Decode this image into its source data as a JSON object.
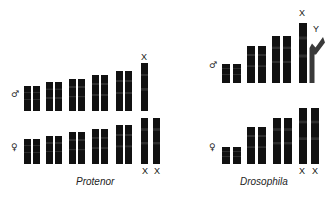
{
  "figure": {
    "background_color": "#ffffff",
    "chromosome_color": "#111111",
    "y_chromosome_color": "#3a3a3a",
    "label_color": "#141414"
  },
  "panels": [
    {
      "id": "protenor",
      "species_label": "Protenor",
      "rows": [
        {
          "id": "protenor-male",
          "sex": "male",
          "sex_symbol": "♂",
          "karyotype_note": "XO",
          "chromosomes": [
            {
              "name": "autosome-1a",
              "kind": "autosome",
              "label": ""
            },
            {
              "name": "autosome-1b",
              "kind": "autosome",
              "label": ""
            },
            {
              "name": "autosome-2a",
              "kind": "autosome",
              "label": ""
            },
            {
              "name": "autosome-2b",
              "kind": "autosome",
              "label": ""
            },
            {
              "name": "autosome-3a",
              "kind": "autosome",
              "label": ""
            },
            {
              "name": "autosome-3b",
              "kind": "autosome",
              "label": ""
            },
            {
              "name": "autosome-4a",
              "kind": "autosome",
              "label": ""
            },
            {
              "name": "autosome-4b",
              "kind": "autosome",
              "label": ""
            },
            {
              "name": "autosome-5a",
              "kind": "autosome",
              "label": ""
            },
            {
              "name": "autosome-5b",
              "kind": "autosome",
              "label": ""
            },
            {
              "name": "x-chromosome",
              "kind": "sex-x",
              "label": "X",
              "label_position": "above"
            }
          ]
        },
        {
          "id": "protenor-female",
          "sex": "female",
          "sex_symbol": "♀",
          "karyotype_note": "XX",
          "chromosomes": [
            {
              "name": "autosome-1a",
              "kind": "autosome",
              "label": ""
            },
            {
              "name": "autosome-1b",
              "kind": "autosome",
              "label": ""
            },
            {
              "name": "autosome-2a",
              "kind": "autosome",
              "label": ""
            },
            {
              "name": "autosome-2b",
              "kind": "autosome",
              "label": ""
            },
            {
              "name": "autosome-3a",
              "kind": "autosome",
              "label": ""
            },
            {
              "name": "autosome-3b",
              "kind": "autosome",
              "label": ""
            },
            {
              "name": "autosome-4a",
              "kind": "autosome",
              "label": ""
            },
            {
              "name": "autosome-4b",
              "kind": "autosome",
              "label": ""
            },
            {
              "name": "autosome-5a",
              "kind": "autosome",
              "label": ""
            },
            {
              "name": "autosome-5b",
              "kind": "autosome",
              "label": ""
            },
            {
              "name": "x-chromosome-1",
              "kind": "sex-x",
              "label": "X",
              "label_position": "below"
            },
            {
              "name": "x-chromosome-2",
              "kind": "sex-x",
              "label": "X",
              "label_position": "below"
            }
          ]
        }
      ]
    },
    {
      "id": "drosophila",
      "species_label": "Drosophila",
      "rows": [
        {
          "id": "drosophila-male",
          "sex": "male",
          "sex_symbol": "♂",
          "karyotype_note": "XY",
          "chromosomes": [
            {
              "name": "autosome-1a",
              "kind": "autosome",
              "label": ""
            },
            {
              "name": "autosome-1b",
              "kind": "autosome",
              "label": ""
            },
            {
              "name": "autosome-2a",
              "kind": "autosome",
              "label": ""
            },
            {
              "name": "autosome-2b",
              "kind": "autosome",
              "label": ""
            },
            {
              "name": "autosome-3a",
              "kind": "autosome",
              "label": ""
            },
            {
              "name": "autosome-3b",
              "kind": "autosome",
              "label": ""
            },
            {
              "name": "x-chromosome",
              "kind": "sex-x",
              "label": "X",
              "label_position": "above"
            },
            {
              "name": "y-chromosome",
              "kind": "sex-y",
              "label": "Y",
              "label_position": "above",
              "shape": "bent-hook"
            }
          ]
        },
        {
          "id": "drosophila-female",
          "sex": "female",
          "sex_symbol": "♀",
          "karyotype_note": "XX",
          "chromosomes": [
            {
              "name": "autosome-1a",
              "kind": "autosome",
              "label": ""
            },
            {
              "name": "autosome-1b",
              "kind": "autosome",
              "label": ""
            },
            {
              "name": "autosome-2a",
              "kind": "autosome",
              "label": ""
            },
            {
              "name": "autosome-2b",
              "kind": "autosome",
              "label": ""
            },
            {
              "name": "autosome-3a",
              "kind": "autosome",
              "label": ""
            },
            {
              "name": "autosome-3b",
              "kind": "autosome",
              "label": ""
            },
            {
              "name": "x-chromosome-1",
              "kind": "sex-x",
              "label": "X",
              "label_position": "below"
            },
            {
              "name": "x-chromosome-2",
              "kind": "sex-x",
              "label": "X",
              "label_position": "below"
            }
          ]
        }
      ]
    }
  ],
  "geometry": {
    "protenor": {
      "male": {
        "baseline_y": 111,
        "sex_symbol": {
          "x": 11,
          "y": 90
        },
        "bars": [
          {
            "x": 24,
            "w": 7,
            "h": 25
          },
          {
            "x": 33,
            "w": 7,
            "h": 25
          },
          {
            "x": 46,
            "w": 7,
            "h": 29
          },
          {
            "x": 55,
            "w": 7,
            "h": 29
          },
          {
            "x": 69,
            "w": 7,
            "h": 32
          },
          {
            "x": 78,
            "w": 7,
            "h": 32
          },
          {
            "x": 92,
            "w": 7,
            "h": 36
          },
          {
            "x": 101,
            "w": 7,
            "h": 36
          },
          {
            "x": 116,
            "w": 7,
            "h": 40
          },
          {
            "x": 125,
            "w": 7,
            "h": 40
          },
          {
            "x": 141,
            "w": 7,
            "h": 48
          }
        ],
        "labels": [
          {
            "text_idx": 10,
            "x": 141,
            "y": 53
          }
        ]
      },
      "female": {
        "baseline_y": 164,
        "sex_symbol": {
          "x": 11,
          "y": 143
        },
        "bars": [
          {
            "x": 24,
            "w": 7,
            "h": 25
          },
          {
            "x": 33,
            "w": 7,
            "h": 25
          },
          {
            "x": 46,
            "w": 7,
            "h": 28
          },
          {
            "x": 55,
            "w": 7,
            "h": 28
          },
          {
            "x": 69,
            "w": 7,
            "h": 32
          },
          {
            "x": 78,
            "w": 7,
            "h": 32
          },
          {
            "x": 92,
            "w": 7,
            "h": 35
          },
          {
            "x": 101,
            "w": 7,
            "h": 35
          },
          {
            "x": 116,
            "w": 7,
            "h": 39
          },
          {
            "x": 125,
            "w": 7,
            "h": 39
          },
          {
            "x": 141,
            "w": 7,
            "h": 46
          },
          {
            "x": 153,
            "w": 7,
            "h": 46
          }
        ],
        "labels": [
          {
            "text_idx": 10,
            "x": 142,
            "y": 167
          },
          {
            "text_idx": 11,
            "x": 154,
            "y": 167
          }
        ]
      },
      "species_label_pos": {
        "x": 76,
        "y": 177
      }
    },
    "drosophila": {
      "male": {
        "baseline_y": 83,
        "sex_symbol": {
          "x": 209,
          "y": 61
        },
        "bars": [
          {
            "x": 222,
            "w": 8,
            "h": 19
          },
          {
            "x": 233,
            "w": 8,
            "h": 19
          },
          {
            "x": 247,
            "w": 8,
            "h": 37
          },
          {
            "x": 258,
            "w": 8,
            "h": 37
          },
          {
            "x": 272,
            "w": 8,
            "h": 47
          },
          {
            "x": 283,
            "w": 8,
            "h": 47
          },
          {
            "x": 299,
            "w": 8,
            "h": 60
          }
        ],
        "ybar": {
          "x": 307,
          "y": 34,
          "w": 18,
          "h": 49
        },
        "labels": [
          {
            "text_idx": 6,
            "x": 299,
            "y": 9
          },
          {
            "text_idx": 7,
            "x": 313,
            "y": 25
          }
        ]
      },
      "female": {
        "baseline_y": 164,
        "sex_symbol": {
          "x": 209,
          "y": 143
        },
        "bars": [
          {
            "x": 222,
            "w": 8,
            "h": 17
          },
          {
            "x": 233,
            "w": 8,
            "h": 17
          },
          {
            "x": 247,
            "w": 8,
            "h": 37
          },
          {
            "x": 258,
            "w": 8,
            "h": 37
          },
          {
            "x": 273,
            "w": 8,
            "h": 46
          },
          {
            "x": 284,
            "w": 8,
            "h": 46
          },
          {
            "x": 299,
            "w": 8,
            "h": 56
          },
          {
            "x": 311,
            "w": 8,
            "h": 56
          }
        ],
        "labels": [
          {
            "text_idx": 6,
            "x": 299,
            "y": 167
          },
          {
            "text_idx": 7,
            "x": 312,
            "y": 167
          }
        ]
      },
      "species_label_pos": {
        "x": 240,
        "y": 177
      }
    }
  }
}
